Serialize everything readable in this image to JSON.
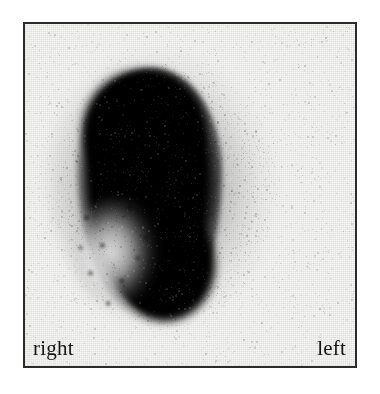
{
  "image": {
    "type": "scintigraphy-scan",
    "modality": "nuclear-medicine-gamma-camera",
    "frame": {
      "border_color": "#2b2b2b",
      "background_color": "#f6f6f5"
    },
    "labels": {
      "right": "right",
      "left": "left"
    },
    "features": {
      "uptake_region": {
        "name": "radiotracer-uptake",
        "color": "#000000",
        "shape": "pear",
        "position": "left-of-center"
      },
      "cold_region": {
        "name": "photopenic-defect",
        "color": "#f2f2f2",
        "position": "lower-left-of-uptake"
      },
      "background_noise": {
        "name": "count-speckle",
        "color": "#4a4a4a"
      }
    }
  }
}
